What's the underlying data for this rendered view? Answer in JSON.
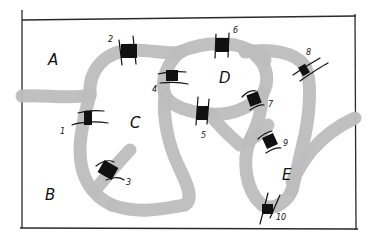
{
  "diagram": {
    "type": "bridge-map",
    "colors": {
      "river": "#bdbdbd",
      "bridge": "#111111",
      "frame": "#2a2a2a",
      "background": "#ffffff"
    },
    "regions": [
      {
        "id": "A",
        "label": "A"
      },
      {
        "id": "B",
        "label": "B"
      },
      {
        "id": "C",
        "label": "C"
      },
      {
        "id": "D",
        "label": "D"
      },
      {
        "id": "E",
        "label": "E"
      }
    ],
    "bridges": [
      {
        "id": 1,
        "label": "1"
      },
      {
        "id": 2,
        "label": "2"
      },
      {
        "id": 3,
        "label": "3"
      },
      {
        "id": 4,
        "label": "4"
      },
      {
        "id": 5,
        "label": "5"
      },
      {
        "id": 6,
        "label": "6"
      },
      {
        "id": 7,
        "label": "7"
      },
      {
        "id": 8,
        "label": "8"
      },
      {
        "id": 9,
        "label": "9"
      },
      {
        "id": 10,
        "label": "10"
      }
    ]
  }
}
